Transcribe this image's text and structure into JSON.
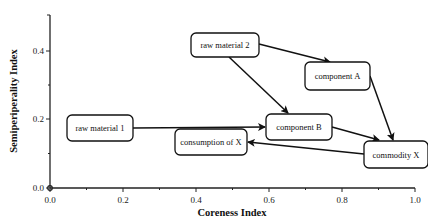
{
  "axes": {
    "x": {
      "title": "Coreness Index",
      "ticks": [
        {
          "value": 0.0,
          "label": "0.0",
          "px": 50
        },
        {
          "value": 0.2,
          "label": "0.2",
          "px": 123
        },
        {
          "value": 0.4,
          "label": "0.4",
          "px": 196
        },
        {
          "value": 0.6,
          "label": "0.6",
          "px": 269
        },
        {
          "value": 0.8,
          "label": "0.8",
          "px": 342
        },
        {
          "value": 1.0,
          "label": "1.0",
          "px": 415
        }
      ]
    },
    "y": {
      "title": "Semiperiperality Index",
      "ticks": [
        {
          "value": 0.0,
          "label": "0.0",
          "px": 188
        },
        {
          "value": 0.2,
          "label": "0.2",
          "px": 119
        },
        {
          "value": 0.4,
          "label": "0.4",
          "px": 51
        }
      ]
    }
  },
  "nodes": [
    {
      "id": "raw_material_1",
      "label": "raw material 1",
      "x": 67,
      "y": 115,
      "w": 66,
      "h": 26,
      "coreness": 0.15,
      "semiperiphery": 0.2
    },
    {
      "id": "raw_material_2",
      "label": "raw material 2",
      "x": 191,
      "y": 33,
      "w": 68,
      "h": 24,
      "coreness": 0.46,
      "semiperiphery": 0.43
    },
    {
      "id": "component_A",
      "label": "component A",
      "x": 305,
      "y": 62,
      "w": 65,
      "h": 28,
      "coreness": 0.78,
      "semiperiphery": 0.36
    },
    {
      "id": "component_B",
      "label": "component B",
      "x": 266,
      "y": 114,
      "w": 66,
      "h": 26,
      "coreness": 0.66,
      "semiperiphery": 0.2
    },
    {
      "id": "consumption_of_X",
      "label": "consumption of X",
      "x": 175,
      "y": 129,
      "w": 72,
      "h": 26,
      "coreness": 0.49,
      "semiperiphery": 0.14
    },
    {
      "id": "commodity_X",
      "label": "commodity X",
      "x": 364,
      "y": 141,
      "w": 64,
      "h": 27,
      "coreness": 0.94,
      "semiperiphery": 0.12
    }
  ],
  "edges": [
    {
      "from": "raw_material_1",
      "to": "component_B",
      "x1": 133,
      "y1": 128,
      "x2": 265,
      "y2": 127
    },
    {
      "from": "raw_material_2",
      "to": "component_A",
      "x1": 259,
      "y1": 44,
      "x2": 330,
      "y2": 62
    },
    {
      "from": "raw_material_2",
      "to": "component_B",
      "x1": 229,
      "y1": 57,
      "x2": 288,
      "y2": 113
    },
    {
      "from": "component_A",
      "to": "commodity_X",
      "x1": 370,
      "y1": 76,
      "x2": 393,
      "y2": 140
    },
    {
      "from": "component_B",
      "to": "commodity_X",
      "x1": 332,
      "y1": 127,
      "x2": 379,
      "y2": 140
    },
    {
      "from": "commodity_X",
      "to": "consumption_of_X",
      "x1": 364,
      "y1": 154,
      "x2": 248,
      "y2": 142
    }
  ]
}
